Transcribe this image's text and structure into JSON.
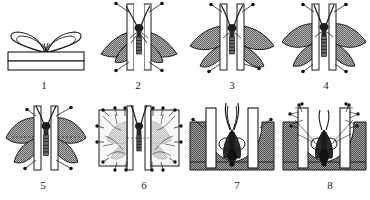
{
  "figure": {
    "panel_count": 8,
    "rows": 2,
    "columns": 4,
    "background_color": "#ffffff",
    "ink_color": "#1a1a1a",
    "wing_fill_color": "#8c8c8c",
    "board_fill_color": "#ffffff",
    "groove_fill_color": "#9a9a9a",
    "paper_fill_color": "#f2f2f2"
  },
  "panels": [
    {
      "number": "1",
      "caption": "1",
      "name": "specimen-on-box",
      "description": "Unpinned specimen resting with wings outlined on a rectangular relaxing box",
      "elements": [
        "butterfly-outline",
        "box",
        "box-lid-line"
      ],
      "wings_shaded": false,
      "pin_count": 0
    },
    {
      "number": "2",
      "caption": "2",
      "name": "wings-drooped-between-boards",
      "description": "Specimen pinned through thorax into the groove, wings still drooping down",
      "elements": [
        "left-board",
        "right-board",
        "groove",
        "body",
        "antennae",
        "wings-down"
      ],
      "wings_shaded": true,
      "pin_count": 4
    },
    {
      "number": "3",
      "caption": "3",
      "name": "wings-partly-raised",
      "description": "Forewings drawn forward with a pin, hindwings still low",
      "elements": [
        "left-board",
        "right-board",
        "groove",
        "body",
        "antennae",
        "wings-partial"
      ],
      "wings_shaded": true,
      "pin_count": 4
    },
    {
      "number": "4",
      "caption": "4",
      "name": "wings-nearly-set",
      "description": "Both wing pairs brought up close to final position",
      "elements": [
        "left-board",
        "right-board",
        "groove",
        "body",
        "antennae",
        "wings-raised"
      ],
      "wings_shaded": true,
      "pin_count": 4
    },
    {
      "number": "5",
      "caption": "5",
      "name": "wings-fully-spread",
      "description": "Wings fully spread and symmetrical, hind margins in line",
      "elements": [
        "left-board",
        "right-board",
        "groove",
        "body",
        "antennae",
        "wings-spread"
      ],
      "wings_shaded": true,
      "pin_count": 4
    },
    {
      "number": "6",
      "caption": "6",
      "name": "wings-covered-with-paper-strips",
      "description": "Spread wings held flat under glassine paper strips fixed with many pins",
      "elements": [
        "left-board",
        "right-board",
        "groove",
        "body",
        "wings-spread",
        "paper-strip-left",
        "paper-strip-right"
      ],
      "wings_shaded": true,
      "pin_count": 16
    },
    {
      "number": "7",
      "caption": "7",
      "name": "moth-in-deep-groove",
      "description": "Moth pinned in a deep groove with wings still folded roof-like above the body",
      "elements": [
        "left-board",
        "right-board",
        "deep-groove",
        "body",
        "antennae",
        "wings-folded"
      ],
      "pin_count": 2
    },
    {
      "number": "8",
      "caption": "8",
      "name": "moth-secured-with-paper",
      "description": "Same moth with wings pressed against the board faces and pinned paper strips",
      "elements": [
        "left-board",
        "right-board",
        "deep-groove",
        "body",
        "wings-folded",
        "paper-strip-left",
        "paper-strip-right"
      ],
      "pin_count": 8
    }
  ],
  "captions": {
    "p1": "1",
    "p2": "2",
    "p3": "3",
    "p4": "4",
    "p5": "5",
    "p6": "6",
    "p7": "7",
    "p8": "8"
  }
}
